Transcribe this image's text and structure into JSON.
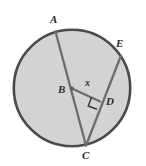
{
  "figure": {
    "kind": "circle-geometry-diagram",
    "background_color": "#ffffff",
    "circle": {
      "fill_color": "#d3d3d3",
      "stroke_color": "#4a4a4a",
      "stroke_width": 2.6,
      "center_x": 72,
      "center_y": 88,
      "radius": 59
    },
    "line_color": "#6d6d6d",
    "line_width": 2.3,
    "points": [
      {
        "name": "A",
        "label": "A",
        "x": 55,
        "y": 30,
        "on_circle": true
      },
      {
        "name": "E",
        "label": "E",
        "x": 122,
        "y": 55,
        "on_circle": true
      },
      {
        "name": "B",
        "label": "B",
        "x": 72,
        "y": 88,
        "on_circle": false,
        "is_center": true
      },
      {
        "name": "D",
        "label": "D",
        "x": 99,
        "y": 101,
        "on_circle": false
      },
      {
        "name": "C",
        "label": "C",
        "x": 86,
        "y": 146,
        "on_circle": true
      }
    ],
    "segments": [
      {
        "name": "segment-AC",
        "from": "A",
        "to": "C"
      },
      {
        "name": "segment-EC",
        "from": "E",
        "to": "C"
      },
      {
        "name": "segment-BD",
        "from": "B",
        "to": "D"
      }
    ],
    "angle_markers": [
      {
        "name": "right-angle-at-D",
        "at": "D",
        "type": "right-angle",
        "size": 9
      }
    ],
    "variable_labels": [
      {
        "name": "angle-x",
        "label": "x",
        "x": 89,
        "y": 83
      }
    ]
  }
}
